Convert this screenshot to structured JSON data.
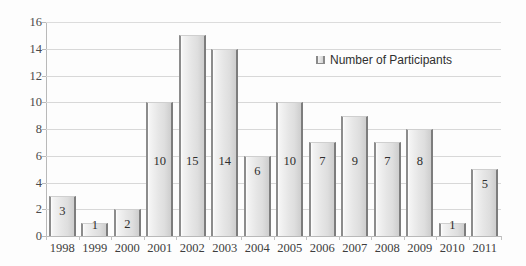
{
  "chart_data": {
    "type": "bar",
    "title": "",
    "xlabel": "",
    "ylabel": "",
    "categories": [
      "1998",
      "1999",
      "2000",
      "2001",
      "2002",
      "2003",
      "2004",
      "2005",
      "2006",
      "2007",
      "2008",
      "2009",
      "2010",
      "2011"
    ],
    "values": [
      3,
      1,
      2,
      10,
      15,
      14,
      6,
      10,
      7,
      9,
      7,
      8,
      1,
      5
    ],
    "series": [
      {
        "name": "Number of Participants",
        "values": [
          3,
          1,
          2,
          10,
          15,
          14,
          6,
          10,
          7,
          9,
          7,
          8,
          1,
          5
        ]
      }
    ],
    "ylim": [
      0,
      16
    ],
    "ytick_step": 2,
    "yticks": [
      "16",
      "14",
      "12",
      "10",
      "8",
      "6",
      "4",
      "2",
      "0"
    ],
    "grid": true,
    "legend": {
      "position": "inside-top-right",
      "entries": [
        "Number of Participants"
      ]
    },
    "data_labels": [
      "3",
      "1",
      "2",
      "10",
      "15",
      "14",
      "6",
      "10",
      "7",
      "9",
      "7",
      "8",
      "1",
      "5"
    ],
    "colors": {
      "bar_fill_light": "#f4f4f4",
      "bar_fill_dark": "#cfcfcf",
      "bar_edge": "#8c8c8c",
      "gridline": "#d8d8d8",
      "axis": "#b9b9b9",
      "text": "#3b3b3b",
      "background": "#fdfdfd"
    }
  },
  "legend": {
    "label": "Number of Participants"
  }
}
